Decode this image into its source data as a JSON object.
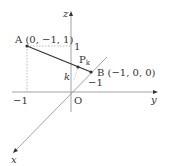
{
  "diagram": {
    "type": "3d-coordinate-axes",
    "axes": {
      "x_label": "x",
      "y_label": "y",
      "z_label": "z",
      "origin_label": "O"
    },
    "ticks": {
      "z_one": "1",
      "y_neg_one": "−1",
      "x_neg_one": "−1"
    },
    "points": {
      "A": {
        "label": "A (0, −1, 1)"
      },
      "B": {
        "label": "B (−1, 0, 0)"
      },
      "P": {
        "label": "P",
        "subscript": "k"
      }
    },
    "height_label": "k",
    "colors": {
      "axis": "#999999",
      "segment": "#333333",
      "dotted": "#aaaaaa",
      "text": "#333333"
    }
  }
}
